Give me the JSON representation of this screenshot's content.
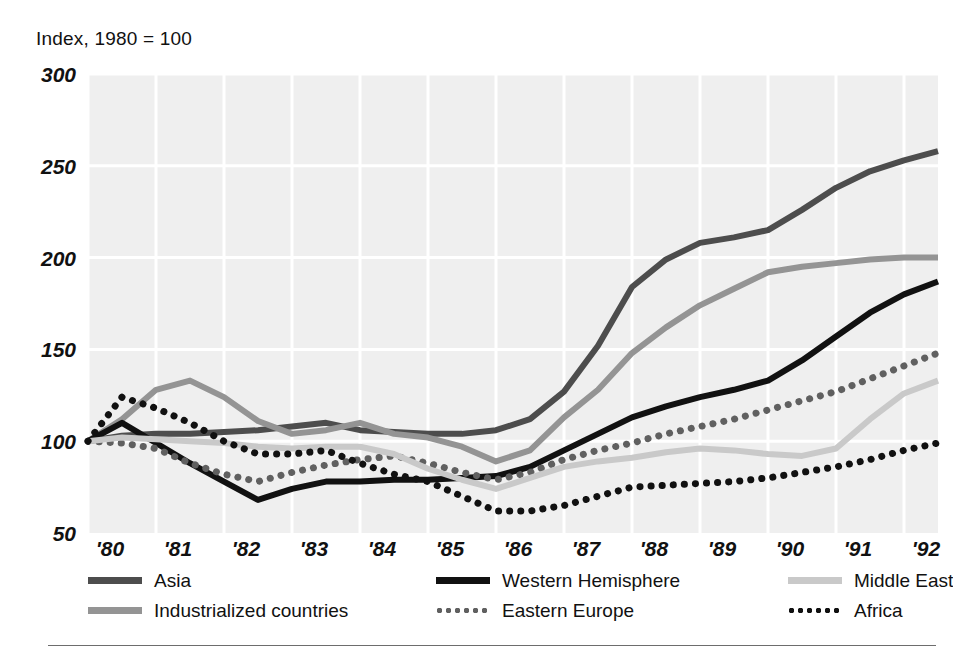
{
  "title": "Index, 1980 = 100",
  "colors": {
    "plot_background": "#efefef",
    "gridline": "#ffffff",
    "asia": "#4d4d4d",
    "western_hemisphere": "#111111",
    "middle_east": "#c9c9c9",
    "industrialized_countries": "#949494",
    "eastern_europe": "#606060",
    "africa": "#111111",
    "text": "#111111",
    "rule": "#6d6d6d"
  },
  "legend": {
    "rows": [
      [
        {
          "label": "Asia",
          "series": "asia",
          "style": "solid",
          "color": "#4d4d4d"
        },
        {
          "label": "Western Hemisphere",
          "series": "western_hemisphere",
          "style": "solid",
          "color": "#111111"
        },
        {
          "label": "Middle East",
          "series": "middle_east",
          "style": "solid",
          "color": "#c9c9c9"
        }
      ],
      [
        {
          "label": "Industrialized countries",
          "series": "industrialized_countries",
          "style": "solid",
          "color": "#949494"
        },
        {
          "label": "Eastern Europe",
          "series": "eastern_europe",
          "style": "dotted",
          "color": "#606060"
        },
        {
          "label": "Africa",
          "series": "africa",
          "style": "dotted",
          "color": "#111111"
        }
      ]
    ]
  },
  "chart_data": {
    "type": "line",
    "title": "Index, 1980 = 100",
    "xlabel": "",
    "ylabel": "Index, 1980 = 100",
    "xlim": [
      1980,
      1992.5
    ],
    "ylim": [
      50,
      300
    ],
    "yticks": [
      50,
      100,
      150,
      200,
      250,
      300
    ],
    "ytick_labels": [
      "50",
      "100",
      "150",
      "200",
      "250",
      "300"
    ],
    "xticks": [
      1980,
      1981,
      1982,
      1983,
      1984,
      1985,
      1986,
      1987,
      1988,
      1989,
      1990,
      1991,
      1992
    ],
    "xtick_labels": [
      "'80",
      "'81",
      "'82",
      "'83",
      "'84",
      "'85",
      "'86",
      "'87",
      "'88",
      "'89",
      "'90",
      "'91",
      "'92"
    ],
    "grid": true,
    "legend_position": "below",
    "x": [
      1980.0,
      1980.5,
      1981.0,
      1981.5,
      1982.0,
      1982.5,
      1983.0,
      1983.5,
      1984.0,
      1984.5,
      1985.0,
      1985.5,
      1986.0,
      1986.5,
      1987.0,
      1987.5,
      1988.0,
      1988.5,
      1989.0,
      1989.5,
      1990.0,
      1990.5,
      1991.0,
      1991.5,
      1992.0,
      1992.5
    ],
    "series": [
      {
        "name": "Asia",
        "style": "solid",
        "color": "#4d4d4d",
        "values": [
          100,
          103,
          104,
          104,
          105,
          106,
          108,
          110,
          106,
          105,
          104,
          104,
          106,
          112,
          127,
          152,
          184,
          199,
          208,
          211,
          215,
          226,
          238,
          247,
          253,
          258
        ]
      },
      {
        "name": "Industrialized countries",
        "style": "solid",
        "color": "#949494",
        "values": [
          100,
          112,
          128,
          133,
          124,
          111,
          104,
          106,
          110,
          104,
          102,
          97,
          89,
          95,
          113,
          128,
          148,
          162,
          174,
          183,
          192,
          195,
          197,
          199,
          200,
          200
        ]
      },
      {
        "name": "Western Hemisphere",
        "style": "solid",
        "color": "#111111",
        "values": [
          100,
          110,
          99,
          88,
          78,
          68,
          74,
          78,
          78,
          79,
          79,
          80,
          81,
          86,
          95,
          104,
          113,
          119,
          124,
          128,
          133,
          144,
          157,
          170,
          180,
          187
        ]
      },
      {
        "name": "Eastern Europe",
        "style": "dotted",
        "color": "#606060",
        "values": [
          100,
          99,
          96,
          88,
          82,
          78,
          83,
          87,
          90,
          92,
          88,
          83,
          79,
          83,
          90,
          95,
          99,
          104,
          108,
          112,
          117,
          122,
          127,
          134,
          141,
          148
        ]
      },
      {
        "name": "Middle East",
        "style": "solid",
        "color": "#c9c9c9",
        "values": [
          100,
          102,
          101,
          100,
          99,
          97,
          96,
          97,
          97,
          93,
          85,
          79,
          74,
          80,
          86,
          89,
          91,
          94,
          96,
          95,
          93,
          92,
          96,
          112,
          126,
          133
        ]
      },
      {
        "name": "Africa",
        "style": "dotted",
        "color": "#111111",
        "values": [
          100,
          124,
          118,
          110,
          100,
          93,
          93,
          95,
          88,
          82,
          78,
          70,
          62,
          62,
          65,
          70,
          75,
          76,
          77,
          78,
          80,
          83,
          86,
          90,
          95,
          99
        ]
      }
    ]
  }
}
